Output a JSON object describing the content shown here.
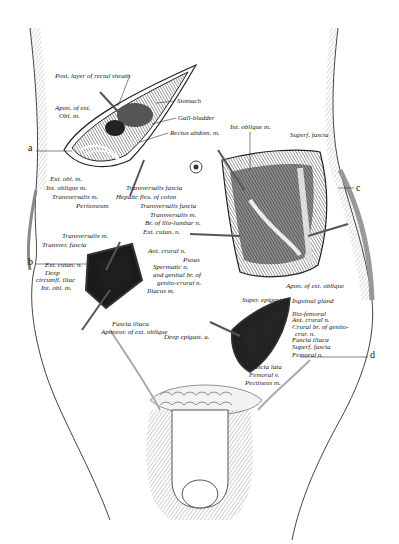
{
  "figure": {
    "letters": [
      {
        "id": "a",
        "x": 28,
        "y": 148
      },
      {
        "id": "b",
        "x": 28,
        "y": 262
      },
      {
        "id": "c",
        "x": 356,
        "y": 188
      },
      {
        "id": "d",
        "x": 370,
        "y": 355
      }
    ],
    "labels": [
      {
        "text": "Post. layer of rectal sheath",
        "x": 55,
        "y": 78
      },
      {
        "text": "Stomach",
        "x": 177,
        "y": 103
      },
      {
        "text": "Apon. of ext.",
        "x": 55,
        "y": 110
      },
      {
        "text": "Obl. m.",
        "x": 59,
        "y": 118
      },
      {
        "text": "Gall-bladder",
        "x": 178,
        "y": 120
      },
      {
        "text": "Rectus abdom. m.",
        "x": 170,
        "y": 135
      },
      {
        "text": "Int. oblique m.",
        "x": 230,
        "y": 129
      },
      {
        "text": "Superf. fascia",
        "x": 290,
        "y": 137
      },
      {
        "text": "Ext. obl. m.",
        "x": 50,
        "y": 181
      },
      {
        "text": "Int. oblique m.",
        "x": 46,
        "y": 190
      },
      {
        "text": "Transversalis m.",
        "x": 52,
        "y": 199
      },
      {
        "text": "Peritoneum",
        "x": 76,
        "y": 208
      },
      {
        "text": "Transversalis fascia",
        "x": 126,
        "y": 190
      },
      {
        "text": "Hepatic flex. of colon",
        "x": 116,
        "y": 199
      },
      {
        "text": "Transversalis fascia",
        "x": 140,
        "y": 208
      },
      {
        "text": "Transversalis m.",
        "x": 150,
        "y": 217
      },
      {
        "text": "Br. of ilio-lumbar n.",
        "x": 145,
        "y": 225
      },
      {
        "text": "Ext. cutan. n.",
        "x": 143,
        "y": 234
      },
      {
        "text": "Ant. crural n.",
        "x": 148,
        "y": 253
      },
      {
        "text": "Psoas",
        "x": 183,
        "y": 262
      },
      {
        "text": "Spermatic n.",
        "x": 153,
        "y": 269
      },
      {
        "text": "and genital br. of",
        "x": 153,
        "y": 277
      },
      {
        "text": "genito-crural n.",
        "x": 157,
        "y": 285
      },
      {
        "text": "Iliacus m.",
        "x": 147,
        "y": 293
      },
      {
        "text": "Transversalis m.",
        "x": 62,
        "y": 238
      },
      {
        "text": "Transver. fascia",
        "x": 42,
        "y": 247
      },
      {
        "text": "Ext. cutan. n.",
        "x": 45,
        "y": 267
      },
      {
        "text": "Deep",
        "x": 45,
        "y": 275
      },
      {
        "text": "circumfl. iliac",
        "x": 36,
        "y": 282
      },
      {
        "text": "Int. obl. m.",
        "x": 41,
        "y": 290
      },
      {
        "text": "Fascia iliaca",
        "x": 112,
        "y": 326
      },
      {
        "text": "Aponeur. of ext. oblique",
        "x": 101,
        "y": 334
      },
      {
        "text": "Deep epigast. a.",
        "x": 164,
        "y": 339
      },
      {
        "text": "Apon. of ext. oblique",
        "x": 286,
        "y": 288
      },
      {
        "text": "Super. epigast. v.",
        "x": 242,
        "y": 302
      },
      {
        "text": "Inguinal gland",
        "x": 292,
        "y": 303
      },
      {
        "text": "Ilio-femoral",
        "x": 292,
        "y": 316
      },
      {
        "text": "Ant. crural n.",
        "x": 292,
        "y": 322
      },
      {
        "text": "Crural br. of genito-",
        "x": 292,
        "y": 329
      },
      {
        "text": "crur. n.",
        "x": 295,
        "y": 336
      },
      {
        "text": "Fascia iliaca",
        "x": 292,
        "y": 342
      },
      {
        "text": "Superf. fascia",
        "x": 292,
        "y": 349
      },
      {
        "text": "Femoral n.",
        "x": 292,
        "y": 357
      },
      {
        "text": "Fascia lata",
        "x": 250,
        "y": 369
      },
      {
        "text": "Femoral v.",
        "x": 249,
        "y": 377
      },
      {
        "text": "Pectineus m.",
        "x": 245,
        "y": 385
      }
    ]
  }
}
